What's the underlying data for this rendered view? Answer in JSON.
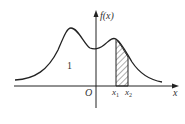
{
  "figure": {
    "y_axis_label": "f(x)",
    "x_axis_label": "x",
    "origin_label": "O",
    "x1_label": "x",
    "x1_sub": "1",
    "x2_label": "x",
    "x2_sub": "2",
    "area_label": "1",
    "colors": {
      "stroke": "#222222",
      "hatch": "#333333"
    }
  }
}
